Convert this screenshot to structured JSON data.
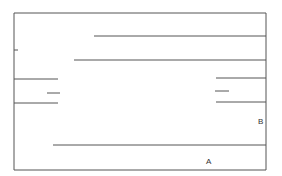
{
  "diagram": {
    "stroke_color": "#555555",
    "lines": [
      {
        "x1": 14,
        "y1": 13,
        "x2": 266,
        "y2": 13
      },
      {
        "x1": 14,
        "y1": 13,
        "x2": 14,
        "y2": 170
      },
      {
        "x1": 266,
        "y1": 13,
        "x2": 266,
        "y2": 170
      },
      {
        "x1": 14,
        "y1": 170,
        "x2": 266,
        "y2": 170
      },
      {
        "x1": 94,
        "y1": 36,
        "x2": 266,
        "y2": 36
      },
      {
        "x1": 74,
        "y1": 60,
        "x2": 266,
        "y2": 60
      },
      {
        "x1": 14,
        "y1": 50,
        "x2": 18,
        "y2": 50
      },
      {
        "x1": 14,
        "y1": 79,
        "x2": 58,
        "y2": 79
      },
      {
        "x1": 47,
        "y1": 93,
        "x2": 60,
        "y2": 93
      },
      {
        "x1": 14,
        "y1": 103,
        "x2": 58,
        "y2": 103
      },
      {
        "x1": 216,
        "y1": 78,
        "x2": 266,
        "y2": 78
      },
      {
        "x1": 215,
        "y1": 91,
        "x2": 229,
        "y2": 91
      },
      {
        "x1": 216,
        "y1": 102,
        "x2": 266,
        "y2": 102
      },
      {
        "x1": 53,
        "y1": 145,
        "x2": 266,
        "y2": 145
      }
    ],
    "labels": [
      {
        "text": "B",
        "x": 258,
        "y": 118
      },
      {
        "text": "A",
        "x": 206,
        "y": 158
      }
    ]
  }
}
